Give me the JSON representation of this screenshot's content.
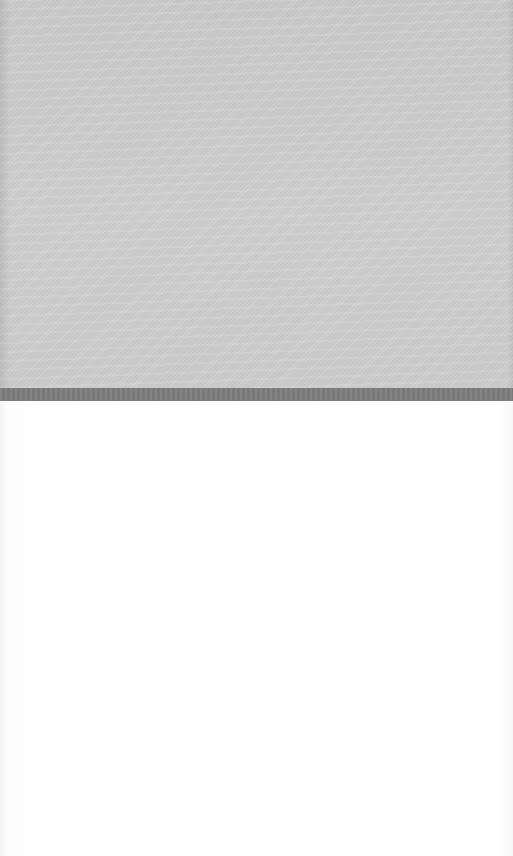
{
  "image": {
    "description": "Photograph of a textured light-gray fabric panel above a darker gray band, with a plain white surface below",
    "regions": [
      {
        "name": "fabric-panel",
        "color": "#cfcfcf"
      },
      {
        "name": "dark-band",
        "color": "#7e7e7e"
      },
      {
        "name": "white-surface",
        "color": "#ffffff"
      }
    ]
  }
}
